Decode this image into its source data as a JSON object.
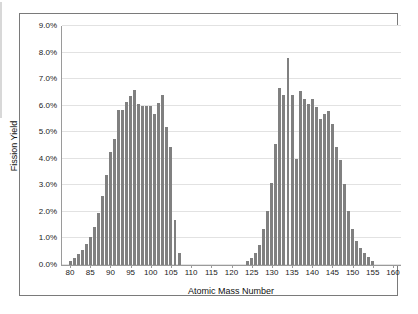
{
  "chart_data": {
    "type": "bar",
    "title": "",
    "xlabel": "Atomic Mass Number",
    "ylabel": "Fission Yield",
    "xlim": [
      78,
      162
    ],
    "ylim": [
      0.0,
      9.0
    ],
    "ytick_labels": [
      "0.0%",
      "1.0%",
      "2.0%",
      "3.0%",
      "4.0%",
      "5.0%",
      "6.0%",
      "7.0%",
      "8.0%",
      "9.0%"
    ],
    "ytick_values": [
      0.0,
      1.0,
      2.0,
      3.0,
      4.0,
      5.0,
      6.0,
      7.0,
      8.0,
      9.0
    ],
    "xtick_labels": [
      "80",
      "85",
      "90",
      "95",
      "100",
      "105",
      "110",
      "115",
      "120",
      "125",
      "130",
      "135",
      "140",
      "145",
      "150",
      "155",
      "160"
    ],
    "xtick_values": [
      80,
      85,
      90,
      95,
      100,
      105,
      110,
      115,
      120,
      125,
      130,
      135,
      140,
      145,
      150,
      155,
      160
    ],
    "grid": "horizontal",
    "legend": "none",
    "bar_color": "#808080",
    "categories": [
      80,
      81,
      82,
      83,
      84,
      85,
      86,
      87,
      88,
      89,
      90,
      91,
      92,
      93,
      94,
      95,
      96,
      97,
      98,
      99,
      100,
      101,
      102,
      103,
      104,
      105,
      106,
      107,
      124,
      125,
      126,
      127,
      128,
      129,
      130,
      131,
      132,
      133,
      134,
      135,
      136,
      137,
      138,
      139,
      140,
      141,
      142,
      143,
      144,
      145,
      146,
      147,
      148,
      149,
      150,
      151,
      152,
      153,
      154,
      155
    ],
    "values": [
      0.15,
      0.25,
      0.4,
      0.55,
      0.8,
      1.05,
      1.45,
      1.95,
      2.6,
      3.4,
      4.25,
      4.75,
      5.85,
      5.85,
      6.15,
      6.35,
      6.6,
      6.05,
      6.0,
      6.0,
      6.0,
      5.7,
      6.1,
      6.4,
      5.2,
      4.45,
      1.7,
      0.45,
      0.15,
      0.25,
      0.45,
      0.75,
      1.35,
      2.05,
      3.1,
      4.55,
      6.65,
      6.4,
      7.8,
      6.4,
      4.0,
      6.55,
      6.25,
      6.05,
      6.25,
      5.95,
      5.5,
      5.7,
      5.8,
      5.3,
      4.45,
      3.95,
      3.05,
      2.05,
      1.35,
      0.9,
      0.65,
      0.45,
      0.3,
      0.15
    ]
  }
}
